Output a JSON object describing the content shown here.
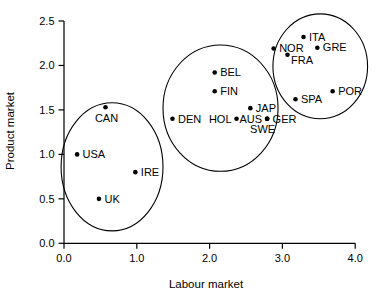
{
  "colors": {
    "ink": "#000000",
    "background": "#ffffff"
  },
  "chart_data": {
    "type": "scatter",
    "title": "",
    "xlabel": "Labour market",
    "ylabel": "Product market",
    "xlim": [
      0,
      4
    ],
    "ylim": [
      0,
      2.5
    ],
    "grid": false,
    "x_ticks": [
      "0.0",
      "1.0",
      "2.0",
      "3.0",
      "4.0"
    ],
    "x_tick_values": [
      0,
      1,
      2,
      3,
      4
    ],
    "y_ticks": [
      "0.0",
      "0.5",
      "1.0",
      "1.5",
      "2.0",
      "2.5"
    ],
    "y_tick_values": [
      0,
      0.5,
      1,
      1.5,
      2,
      2.5
    ],
    "points": [
      {
        "label": "USA",
        "x": 0.18,
        "y": 1.0,
        "label_pos": "right"
      },
      {
        "label": "CAN",
        "x": 0.57,
        "y": 1.53,
        "label_pos": "below"
      },
      {
        "label": "UK",
        "x": 0.48,
        "y": 0.5,
        "label_pos": "right"
      },
      {
        "label": "IRE",
        "x": 0.98,
        "y": 0.8,
        "label_pos": "right"
      },
      {
        "label": "DEN",
        "x": 1.49,
        "y": 1.4,
        "label_pos": "right"
      },
      {
        "label": "BEL",
        "x": 2.07,
        "y": 1.92,
        "label_pos": "right"
      },
      {
        "label": "FIN",
        "x": 2.07,
        "y": 1.71,
        "label_pos": "right"
      },
      {
        "label": "HOL",
        "x": 2.37,
        "y": 1.4,
        "label_pos": "left"
      },
      {
        "label": "JAP",
        "x": 2.56,
        "y": 1.52,
        "label_pos": "right"
      },
      {
        "label": "AUS",
        "x": 2.79,
        "y": 1.4,
        "label_pos": "left"
      },
      {
        "label": "GER",
        "x": 2.79,
        "y": 1.4,
        "label_pos": "right"
      },
      {
        "label": "SWE",
        "x": 2.79,
        "y": 1.4,
        "label_pos": "below-left"
      },
      {
        "label": "NOR",
        "x": 2.88,
        "y": 2.19,
        "label_pos": "right"
      },
      {
        "label": "ITA",
        "x": 3.29,
        "y": 2.32,
        "label_pos": "right"
      },
      {
        "label": "GRE",
        "x": 3.48,
        "y": 2.2,
        "label_pos": "right"
      },
      {
        "label": "FRA",
        "x": 3.07,
        "y": 2.12,
        "label_pos": "below-right"
      },
      {
        "label": "SPA",
        "x": 3.18,
        "y": 1.62,
        "label_pos": "right"
      },
      {
        "label": "POR",
        "x": 3.69,
        "y": 1.71,
        "label_pos": "right"
      }
    ],
    "ellipses": [
      {
        "name": "cluster-low-low",
        "cx": 0.66,
        "cy": 0.86,
        "rx": 0.7,
        "ry": 0.72
      },
      {
        "name": "cluster-mid-mid",
        "cx": 2.15,
        "cy": 1.52,
        "rx": 0.79,
        "ry": 0.71
      },
      {
        "name": "cluster-high-high",
        "cx": 3.52,
        "cy": 1.99,
        "rx": 0.65,
        "ry": 0.59
      }
    ]
  }
}
